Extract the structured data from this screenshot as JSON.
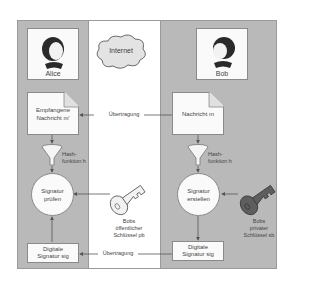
{
  "diagram": {
    "colors": {
      "panel": "#b9b9b9",
      "box": "#fafafa",
      "line": "#555555",
      "background": "#ffffff"
    },
    "internet": {
      "label": "Internet",
      "icon": "cloud-icon"
    },
    "alice": {
      "name": "Alice",
      "icon": "person-icon",
      "received_message": "Empfangene Nachricht m'",
      "received_message_lines": [
        "Empfangene",
        "Nachricht m'"
      ],
      "hash_label_lines": [
        "Hash-",
        "funktion h"
      ],
      "verify_lines": [
        "Signatur",
        "prüfen"
      ],
      "signature_lines": [
        "Digitale",
        "Signatur sig"
      ]
    },
    "bob": {
      "name": "Bob",
      "icon": "person-icon",
      "message": "Nachricht m",
      "hash_label_lines": [
        "Hash-",
        "funktion h"
      ],
      "create_lines": [
        "Signatur",
        "erstellen"
      ],
      "signature_lines": [
        "Digitale",
        "Signatur sig"
      ],
      "private_key_lines": [
        "Bobs",
        "privater",
        "Schlüssel sb"
      ]
    },
    "public_key_lines": [
      "Bobs",
      "öffentlicher",
      "Schlüssel pb"
    ],
    "transfer_label": "Übertragung",
    "transfers": [
      {
        "from": "Nachricht m",
        "to": "Empfangene Nachricht m'",
        "label": "Übertragung"
      },
      {
        "from": "Digitale Signatur sig (Bob)",
        "to": "Digitale Signatur sig (Alice)",
        "label": "Übertragung"
      }
    ]
  }
}
